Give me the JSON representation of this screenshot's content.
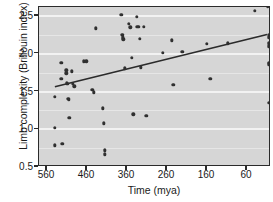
{
  "chart_data": {
    "type": "scatter",
    "title": "",
    "xlabel": "Time (mya)",
    "ylabel": "Limb complexity (Brillouin index)",
    "xlim": [
      580,
      0
    ],
    "ylim": [
      0.5,
      2.62
    ],
    "x_reversed": true,
    "grid": true,
    "legend": "none",
    "xticks": [
      560,
      460,
      360,
      260,
      160,
      60
    ],
    "yticks": [
      0.5,
      1.0,
      1.5,
      2.0,
      2.5
    ],
    "ytick_labels": [
      "0.5",
      "1.0",
      "1.5",
      "2.0",
      "2.5"
    ],
    "xtick_labels": [
      "560",
      "460",
      "360",
      "260",
      "160",
      "60"
    ],
    "point_color": "#303030",
    "panel_color": "#d6d6d6",
    "gridline_color": "#f2f2f2",
    "trendline_color": "#2b2b2b",
    "trendline": {
      "x_start": 540,
      "y_start": 1.55,
      "x_end": 5,
      "y_end": 2.25
    },
    "points": [
      {
        "x": 540,
        "y": 1.43
      },
      {
        "x": 540,
        "y": 1.02
      },
      {
        "x": 540,
        "y": 0.79
      },
      {
        "x": 524,
        "y": 1.88
      },
      {
        "x": 524,
        "y": 1.67
      },
      {
        "x": 522,
        "y": 0.81
      },
      {
        "x": 512,
        "y": 1.78
      },
      {
        "x": 512,
        "y": 1.74
      },
      {
        "x": 510,
        "y": 1.61
      },
      {
        "x": 508,
        "y": 1.6
      },
      {
        "x": 507,
        "y": 1.4
      },
      {
        "x": 505,
        "y": 1.39
      },
      {
        "x": 504,
        "y": 1.15
      },
      {
        "x": 498,
        "y": 1.77
      },
      {
        "x": 496,
        "y": 1.6
      },
      {
        "x": 492,
        "y": 1.57
      },
      {
        "x": 468,
        "y": 1.9
      },
      {
        "x": 462,
        "y": 1.9
      },
      {
        "x": 447,
        "y": 1.52
      },
      {
        "x": 443,
        "y": 1.49
      },
      {
        "x": 438,
        "y": 2.34
      },
      {
        "x": 420,
        "y": 1.28
      },
      {
        "x": 418,
        "y": 1.08
      },
      {
        "x": 416,
        "y": 0.72
      },
      {
        "x": 416,
        "y": 0.67
      },
      {
        "x": 374,
        "y": 2.52
      },
      {
        "x": 372,
        "y": 2.25
      },
      {
        "x": 370,
        "y": 2.22
      },
      {
        "x": 369,
        "y": 2.19
      },
      {
        "x": 366,
        "y": 1.81
      },
      {
        "x": 356,
        "y": 2.4
      },
      {
        "x": 352,
        "y": 2.35
      },
      {
        "x": 348,
        "y": 1.95
      },
      {
        "x": 344,
        "y": 1.2
      },
      {
        "x": 336,
        "y": 2.49
      },
      {
        "x": 334,
        "y": 2.36
      },
      {
        "x": 330,
        "y": 2.36
      },
      {
        "x": 328,
        "y": 2.2
      },
      {
        "x": 326,
        "y": 1.82
      },
      {
        "x": 318,
        "y": 2.36
      },
      {
        "x": 312,
        "y": 1.18
      },
      {
        "x": 270,
        "y": 2.01
      },
      {
        "x": 248,
        "y": 2.18
      },
      {
        "x": 244,
        "y": 1.59
      },
      {
        "x": 222,
        "y": 2.03
      },
      {
        "x": 160,
        "y": 2.13
      },
      {
        "x": 152,
        "y": 1.67
      },
      {
        "x": 108,
        "y": 2.14
      },
      {
        "x": 40,
        "y": 2.57
      },
      {
        "x": 8,
        "y": 2.62
      },
      {
        "x": 6,
        "y": 2.25
      },
      {
        "x": 6,
        "y": 2.22
      },
      {
        "x": 6,
        "y": 2.14
      },
      {
        "x": 6,
        "y": 2.1
      },
      {
        "x": 6,
        "y": 1.88
      },
      {
        "x": 6,
        "y": 1.86
      },
      {
        "x": 6,
        "y": 1.35
      }
    ]
  }
}
